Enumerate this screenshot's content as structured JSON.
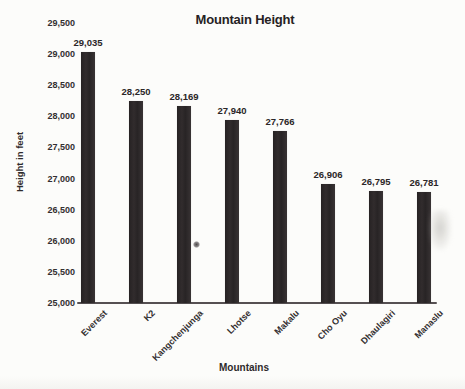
{
  "chart_data": {
    "type": "bar",
    "title": "Mountain Height",
    "xlabel": "Mountains",
    "ylabel": "Height in feet",
    "categories": [
      "Everest",
      "K2",
      "Kangchenjunga",
      "Lhotse",
      "Makalu",
      "Cho Oyu",
      "Dhaulagiri",
      "Manaslu"
    ],
    "values": [
      29035,
      28250,
      28169,
      27940,
      27766,
      26906,
      26795,
      26781
    ],
    "value_labels": [
      "29,035",
      "28,250",
      "28,169",
      "27,940",
      "27,766",
      "26,906",
      "26,795",
      "26,781"
    ],
    "ylim": [
      25000,
      29500
    ],
    "y_step": 500,
    "y_tick_labels": [
      "25,000",
      "25,500",
      "26,000",
      "26,500",
      "27,000",
      "27,500",
      "28,000",
      "28,500",
      "29,000",
      "29,500"
    ],
    "grid": false,
    "legend": false,
    "bar_color": "#2d292a",
    "axis_line_color": "#565052",
    "text_color": "#2b2728",
    "background_color": "#fcfcfa"
  }
}
